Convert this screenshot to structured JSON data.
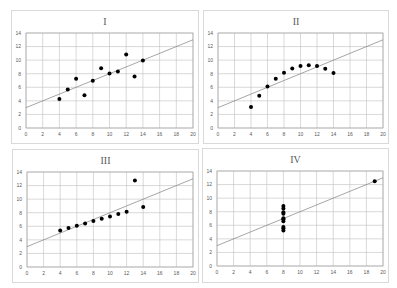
{
  "chart_data": [
    {
      "type": "scatter",
      "title": "I",
      "xlabel": "",
      "ylabel": "",
      "xlim": [
        0,
        20
      ],
      "ylim": [
        0,
        14
      ],
      "xticks": [
        0,
        2,
        4,
        6,
        8,
        10,
        12,
        14,
        16,
        18,
        20
      ],
      "yticks": [
        0,
        2,
        4,
        6,
        8,
        10,
        12,
        14
      ],
      "grid": true,
      "trendline": {
        "intercept": 3.0,
        "slope": 0.5
      },
      "x": [
        10,
        8,
        13,
        9,
        11,
        14,
        6,
        4,
        12,
        7,
        5
      ],
      "y": [
        8.04,
        6.95,
        7.58,
        8.81,
        8.33,
        9.96,
        7.24,
        4.26,
        10.84,
        4.82,
        5.68
      ]
    },
    {
      "type": "scatter",
      "title": "II",
      "xlabel": "",
      "ylabel": "",
      "xlim": [
        0,
        20
      ],
      "ylim": [
        0,
        14
      ],
      "xticks": [
        0,
        2,
        4,
        6,
        8,
        10,
        12,
        14,
        16,
        18,
        20
      ],
      "yticks": [
        0,
        2,
        4,
        6,
        8,
        10,
        12,
        14
      ],
      "grid": true,
      "trendline": {
        "intercept": 3.0,
        "slope": 0.5
      },
      "x": [
        10,
        8,
        13,
        9,
        11,
        14,
        6,
        4,
        12,
        7,
        5
      ],
      "y": [
        9.14,
        8.14,
        8.74,
        8.77,
        9.26,
        8.1,
        6.13,
        3.1,
        9.13,
        7.26,
        4.74
      ]
    },
    {
      "type": "scatter",
      "title": "III",
      "xlabel": "",
      "ylabel": "",
      "xlim": [
        0,
        20
      ],
      "ylim": [
        0,
        14
      ],
      "xticks": [
        0,
        2,
        4,
        6,
        8,
        10,
        12,
        14,
        16,
        18,
        20
      ],
      "yticks": [
        0,
        2,
        4,
        6,
        8,
        10,
        12,
        14
      ],
      "grid": true,
      "trendline": {
        "intercept": 3.0,
        "slope": 0.5
      },
      "x": [
        10,
        8,
        13,
        9,
        11,
        14,
        6,
        4,
        12,
        7,
        5
      ],
      "y": [
        7.46,
        6.77,
        12.74,
        7.11,
        7.81,
        8.84,
        6.08,
        5.39,
        8.15,
        6.42,
        5.73
      ]
    },
    {
      "type": "scatter",
      "title": "IV",
      "xlabel": "",
      "ylabel": "",
      "xlim": [
        0,
        20
      ],
      "ylim": [
        0,
        14
      ],
      "xticks": [
        0,
        2,
        4,
        6,
        8,
        10,
        12,
        14,
        16,
        18,
        20
      ],
      "yticks": [
        0,
        2,
        4,
        6,
        8,
        10,
        12,
        14
      ],
      "grid": true,
      "trendline": {
        "intercept": 3.0,
        "slope": 0.5
      },
      "x": [
        8,
        8,
        8,
        8,
        8,
        8,
        8,
        19,
        8,
        8,
        8
      ],
      "y": [
        6.58,
        5.76,
        7.71,
        8.84,
        8.47,
        7.04,
        5.25,
        12.5,
        5.56,
        7.91,
        6.89
      ]
    }
  ],
  "colors": {
    "marker": "#000000",
    "trendline": "#7f7f7f",
    "grid": "#bfbfbf",
    "axis_text": "#595959",
    "panel_border": "#d9d9d9"
  }
}
